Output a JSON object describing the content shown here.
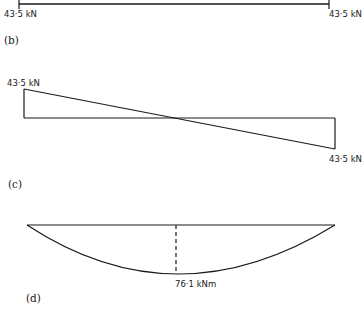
{
  "diagram": {
    "panel_b": {
      "caption": "(b)",
      "left_reaction": "43·5 kN",
      "right_reaction": "43·5 kN"
    },
    "panel_c": {
      "caption": "(c)",
      "title_hint": "Shear force diagram",
      "left_value": "43·5 kN",
      "right_value": "43·5 kN"
    },
    "panel_d": {
      "caption": "(d)",
      "title_hint": "Bending moment diagram",
      "max_moment": "76·1 kNm"
    },
    "colors": {
      "ink": "#1a1a1a",
      "background": "#ffffff"
    }
  }
}
